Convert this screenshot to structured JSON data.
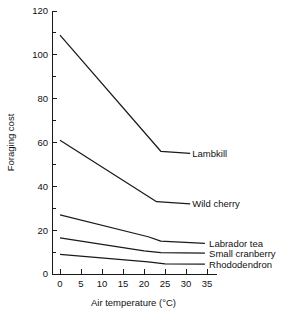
{
  "chart_data": {
    "type": "line",
    "title": "",
    "xlabel": "Air temperature (°C)",
    "ylabel": "Foraging cost",
    "xlim": [
      0,
      35
    ],
    "ylim": [
      0,
      120
    ],
    "xticks": [
      "0",
      "5",
      "10",
      "15",
      "20",
      "25",
      "30",
      "35"
    ],
    "xtick_values": [
      0,
      5,
      10,
      15,
      20,
      25,
      30,
      35
    ],
    "yticks": [
      "0",
      "20",
      "40",
      "60",
      "80",
      "100",
      "120"
    ],
    "ytick_values": [
      0,
      20,
      40,
      60,
      80,
      100,
      120
    ],
    "y_minor_values": [
      10,
      30,
      50,
      70,
      90,
      110
    ],
    "grid": false,
    "legend_position": "right-inline-labels",
    "series": [
      {
        "name": "Lambkill",
        "label": "Lambkill",
        "label_x": 31.5,
        "label_y": 55,
        "x": [
          0,
          24,
          31
        ],
        "y": [
          109,
          56,
          55
        ]
      },
      {
        "name": "Wild cherry",
        "label": "Wild cherry",
        "label_x": 31.5,
        "label_y": 32,
        "x": [
          0,
          23,
          31
        ],
        "y": [
          61,
          33,
          32
        ]
      },
      {
        "name": "Labrador tea",
        "label": "Labrador tea",
        "label_x": 35.5,
        "label_y": 14,
        "x": [
          0,
          21,
          24,
          34.5
        ],
        "y": [
          27,
          17,
          15,
          14
        ]
      },
      {
        "name": "Small cranberry",
        "label": "Small cranberry",
        "label_x": 35.5,
        "label_y": 9.5,
        "x": [
          0,
          20,
          24,
          34.5
        ],
        "y": [
          16.5,
          10.5,
          9.7,
          9.5
        ]
      },
      {
        "name": "Rhododendron",
        "label": "Rhododendron",
        "label_x": 35.5,
        "label_y": 4.5,
        "x": [
          0,
          21,
          25,
          34.5
        ],
        "y": [
          9,
          5.5,
          4.6,
          4.5
        ]
      }
    ]
  },
  "colors": {
    "line": "#1a1a1a",
    "axis": "#1a1a1a",
    "text": "#111111",
    "background": "#ffffff"
  }
}
